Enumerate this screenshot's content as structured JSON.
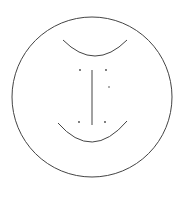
{
  "diagram": {
    "stroke_color": "#444444",
    "background": "#ffffff",
    "circle": {
      "cx": 92,
      "cy": 97,
      "r": 80
    },
    "top_arc": {
      "x1": 63,
      "y1": 40,
      "x2": 127,
      "y2": 40,
      "bottom_y": 56
    },
    "bottom_arc": {
      "x1": 58,
      "y1": 123,
      "x2": 127,
      "y2": 121,
      "bottom_y": 142
    },
    "vertical_line": {
      "x": 92,
      "y1": 70,
      "y2": 125
    },
    "dots": [
      {
        "x": 80,
        "y": 70
      },
      {
        "x": 106,
        "y": 70
      },
      {
        "x": 109,
        "y": 87
      },
      {
        "x": 79,
        "y": 122
      },
      {
        "x": 105,
        "y": 122
      }
    ]
  }
}
